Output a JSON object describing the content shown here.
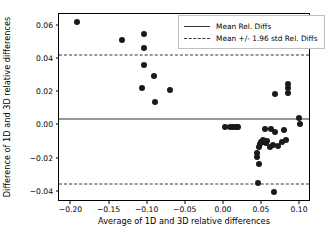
{
  "chart_data": {
    "type": "scatter",
    "title": "",
    "xlabel": "Average of 1D and 3D relative differences",
    "ylabel": "Difference of 1D and 3D relative differences",
    "xlim": [
      -0.215,
      0.113
    ],
    "ylim": [
      -0.0455,
      0.0665
    ],
    "xticks": [
      -0.2,
      -0.15,
      -0.1,
      -0.05,
      0.0,
      0.05,
      0.1
    ],
    "xtick_labels": [
      "-0.20",
      "-0.15",
      "-0.10",
      "-0.05",
      "0.00",
      "0.05",
      "0.10"
    ],
    "yticks": [
      0.06,
      0.04,
      0.02,
      0.0,
      -0.02,
      -0.04
    ],
    "ytick_labels": [
      "0.06",
      "0.04",
      "0.02",
      "0.00",
      "-0.02",
      "-0.04"
    ],
    "grid": false,
    "marker_color": "#1a1a1a",
    "line_color": "#333333",
    "legend_position": "upper right",
    "series": [
      {
        "name": "Relative differences",
        "points": [
          [
            -0.191,
            0.0618
          ],
          [
            -0.132,
            0.051
          ],
          [
            -0.103,
            0.0543
          ],
          [
            -0.103,
            0.0463
          ],
          [
            -0.104,
            0.0359
          ],
          [
            -0.09,
            0.0291
          ],
          [
            -0.106,
            0.0222
          ],
          [
            -0.069,
            0.021
          ],
          [
            -0.089,
            0.0133
          ],
          [
            0.003,
            -0.0014
          ],
          [
            0.01,
            -0.0016
          ],
          [
            0.013,
            -0.0015
          ],
          [
            0.016,
            -0.0016
          ],
          [
            0.018,
            -0.0016
          ],
          [
            0.02,
            -0.0018
          ],
          [
            0.045,
            -0.0172
          ],
          [
            0.045,
            -0.0196
          ],
          [
            0.046,
            -0.0352
          ],
          [
            0.047,
            -0.0241
          ],
          [
            0.048,
            -0.0138
          ],
          [
            0.049,
            -0.012
          ],
          [
            0.05,
            -0.0106
          ],
          [
            0.052,
            -0.0098
          ],
          [
            0.053,
            -0.0091
          ],
          [
            0.054,
            -0.0104
          ],
          [
            0.055,
            -0.003
          ],
          [
            0.056,
            -0.0113
          ],
          [
            0.058,
            -0.0097
          ],
          [
            0.062,
            -0.0138
          ],
          [
            0.063,
            -0.0026
          ],
          [
            0.066,
            -0.0124
          ],
          [
            0.067,
            -0.0405
          ],
          [
            0.068,
            0.0182
          ],
          [
            0.069,
            -0.0043
          ],
          [
            0.072,
            -0.0127
          ],
          [
            0.078,
            -0.0106
          ],
          [
            0.08,
            -0.0036
          ],
          [
            0.083,
            -0.0092
          ],
          [
            0.085,
            0.0241
          ],
          [
            0.085,
            0.0221
          ],
          [
            0.086,
            0.0192
          ],
          [
            0.1,
            0.0037
          ],
          [
            0.101,
            0.0003
          ]
        ]
      }
    ],
    "reference_lines": [
      {
        "name": "mean",
        "style": "solid",
        "value": 0.0031,
        "label": "Mean Rel. Diffs"
      },
      {
        "name": "upper-limit",
        "style": "dashed",
        "value": 0.0421,
        "label": "Mean +/- 1.96 std Rel. Diffs"
      },
      {
        "name": "lower-limit",
        "style": "dashed",
        "value": -0.036,
        "label": "Mean +/- 1.96 std Rel. Diffs"
      }
    ],
    "legend": [
      {
        "label": "Mean Rel. Diffs",
        "style": "solid"
      },
      {
        "label": "Mean +/- 1.96 std Rel. Diffs",
        "style": "dashed"
      }
    ]
  }
}
